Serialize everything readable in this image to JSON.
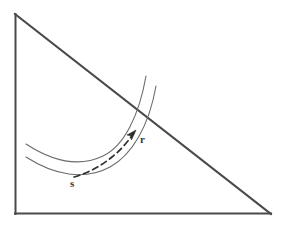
{
  "figure": {
    "type": "geometric-diagram",
    "background_color": "#ffffff",
    "width": 281,
    "height": 230,
    "stroke_colors": {
      "triangle": "#4a4a4a",
      "curve": "#6b6b6b",
      "dashed_arrow": "#2f2f2f",
      "label": "#3a3a3a"
    },
    "triangle": {
      "name": "right-triangle",
      "apex": [
        15,
        14
      ],
      "bottom_left": [
        15,
        214
      ],
      "bottom_right": [
        271,
        214
      ],
      "edges": [
        "vertical-leg",
        "horizontal-leg",
        "hypotenuse"
      ]
    },
    "curves": [
      {
        "name": "outer-arc",
        "start": [
          26,
          144
        ],
        "end": [
          146,
          76
        ]
      },
      {
        "name": "inner-arc",
        "start": [
          26,
          157
        ],
        "end": [
          156,
          86
        ]
      }
    ],
    "arrow": {
      "name": "dashed-trajectory-arrow",
      "style": "dashed",
      "start": [
        74,
        176
      ],
      "end": [
        134,
        132
      ],
      "arrowhead": "at-end"
    },
    "labels": [
      {
        "id": "s",
        "text": "s",
        "x": 73,
        "y": 184
      },
      {
        "id": "r",
        "text": "r",
        "x": 141,
        "y": 142
      }
    ]
  }
}
